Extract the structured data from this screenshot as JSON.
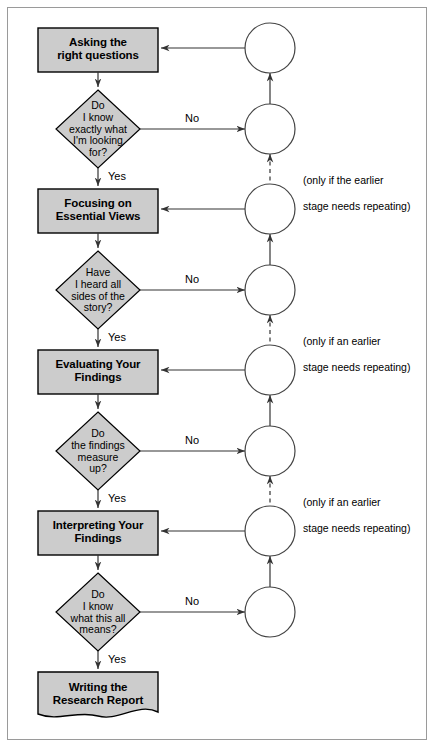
{
  "diagram": {
    "colors": {
      "shape_fill": "#cccccc",
      "shape_stroke": "#000000",
      "circle_fill": "#ffffff",
      "circle_stroke": "#444444",
      "line": "#333333",
      "frame": "#9a9a9a",
      "background": "#ffffff",
      "text": "#000000"
    },
    "process_boxes": [
      {
        "id": "box-asking",
        "label": "Asking the\nright questions",
        "line1": "Asking the",
        "line2": "right questions"
      },
      {
        "id": "box-focusing",
        "label": "Focusing on\nEssential Views",
        "line1": "Focusing on",
        "line2": "Essential Views"
      },
      {
        "id": "box-evaluating",
        "label": "Evaluating Your\nFindings",
        "line1": "Evaluating Your",
        "line2": "Findings"
      },
      {
        "id": "box-interpreting",
        "label": "Interpreting Your\nFindings",
        "line1": "Interpreting Your",
        "line2": "Findings"
      }
    ],
    "document_box": {
      "id": "doc-writing",
      "label": "Writing the\nResearch Report",
      "line1": "Writing the",
      "line2": "Research Report"
    },
    "decisions": [
      {
        "id": "dec-know-exactly",
        "line1": "Do",
        "line2": "I know",
        "line3": "exactly what",
        "line4": "I'm looking",
        "line5": "for?",
        "yes": "Yes",
        "no": "No"
      },
      {
        "id": "dec-heard-all-sides",
        "line1": "Have",
        "line2": "I heard all",
        "line3": "sides of the",
        "line4": "story?",
        "line5": "",
        "yes": "Yes",
        "no": "No"
      },
      {
        "id": "dec-findings-measure",
        "line1": "Do",
        "line2": "the findings",
        "line3": "measure",
        "line4": "up?",
        "line5": "",
        "yes": "Yes",
        "no": "No"
      },
      {
        "id": "dec-know-means",
        "line1": "Do",
        "line2": "I know",
        "line3": "what this all",
        "line4": "means?",
        "line5": "",
        "yes": "Yes",
        "no": "No"
      }
    ],
    "connector_circles": [
      {
        "id": "circle-1"
      },
      {
        "id": "circle-2"
      },
      {
        "id": "circle-3"
      },
      {
        "id": "circle-4"
      },
      {
        "id": "circle-5"
      },
      {
        "id": "circle-6"
      },
      {
        "id": "circle-7"
      },
      {
        "id": "circle-8"
      }
    ],
    "notes": [
      {
        "id": "note-1",
        "text": "(only if the earlier\nstage needs repeating)",
        "line1": "(only if the earlier",
        "line2": "stage needs repeating)"
      },
      {
        "id": "note-2",
        "text": "(only if an earlier\nstage needs repeating)",
        "line1": "(only if an earlier",
        "line2": "stage needs repeating)"
      },
      {
        "id": "note-3",
        "text": "(only if an earlier\nstage needs repeating)",
        "line1": "(only if an earlier",
        "line2": "stage needs repeating)"
      }
    ],
    "edge_labels": {
      "yes": "Yes",
      "no": "No"
    }
  }
}
